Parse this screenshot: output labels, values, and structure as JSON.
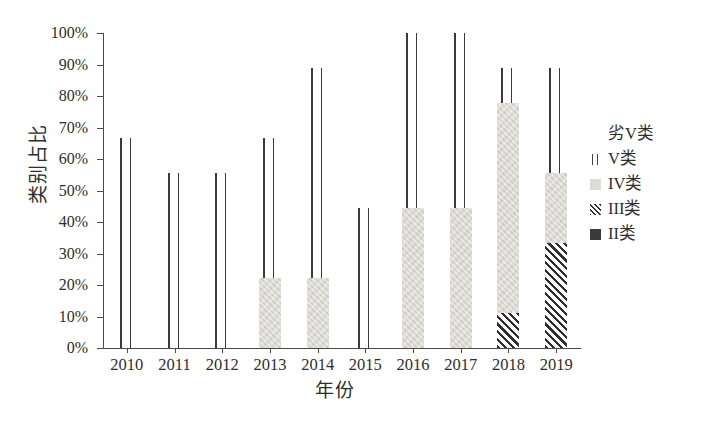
{
  "chart_data": {
    "type": "bar",
    "title": "",
    "subtitle": "",
    "xlabel": "年份",
    "ylabel": "类别占比",
    "categories": [
      "2010",
      "2011",
      "2012",
      "2013",
      "2014",
      "2015",
      "2016",
      "2017",
      "2018",
      "2019"
    ],
    "ylim": [
      0,
      100
    ],
    "ytick_labels": [
      "0%",
      "10%",
      "20%",
      "30%",
      "40%",
      "50%",
      "60%",
      "70%",
      "80%",
      "90%",
      "100%"
    ],
    "ytick_values": [
      0,
      10,
      20,
      30,
      40,
      50,
      60,
      70,
      80,
      90,
      100
    ],
    "grid": false,
    "stacked": true,
    "legend_position": "right",
    "series": [
      {
        "name": "II类",
        "pattern": "solid-dark",
        "color": "#3a3a3a",
        "values": [
          0,
          0,
          0,
          0,
          0,
          0,
          0,
          0,
          0,
          0
        ]
      },
      {
        "name": "III类",
        "pattern": "diagonal-hatch",
        "color": "#2f2f2f",
        "values": [
          0,
          0,
          0,
          0,
          0,
          0,
          0,
          0,
          11.1,
          33.3
        ]
      },
      {
        "name": "IV类",
        "pattern": "light-gray",
        "color": "#dedbd6",
        "values": [
          0,
          0,
          0,
          22.2,
          22.2,
          0,
          44.4,
          44.4,
          66.7,
          22.2
        ]
      },
      {
        "name": "V类",
        "pattern": "vertical-lines",
        "color": "#3a3a3a",
        "values": [
          66.7,
          55.6,
          55.6,
          44.4,
          66.7,
          44.4,
          55.6,
          55.6,
          11.1,
          33.3
        ]
      },
      {
        "name": "劣V类",
        "pattern": "blank-white",
        "color": "#ffffff",
        "values": [
          33.3,
          44.4,
          44.4,
          33.3,
          11.1,
          55.6,
          0,
          0,
          11.1,
          11.1
        ]
      }
    ],
    "bar_tops": [
      66.7,
      55.6,
      55.6,
      66.7,
      88.9,
      44.4,
      100,
      100,
      88.9,
      88.9
    ],
    "annotations": []
  },
  "legend": {
    "items": [
      {
        "label": "劣V类",
        "swatch": "blank-white-swatch"
      },
      {
        "label": "V类",
        "swatch": "vertical-lines-swatch"
      },
      {
        "label": "IV类",
        "swatch": "light-gray-swatch"
      },
      {
        "label": "III类",
        "swatch": "diagonal-hatch-swatch"
      },
      {
        "label": "II类",
        "swatch": "solid-dark-swatch"
      }
    ]
  }
}
